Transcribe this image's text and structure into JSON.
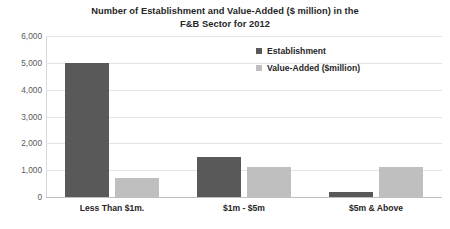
{
  "chart_data": {
    "type": "bar",
    "title": "Number of Establishment and Value-Added ($ million) in the F&B Sector for 2012",
    "title_lines": [
      "Number of Establishment and Value-Added ($ million) in the",
      "F&B Sector for 2012"
    ],
    "xlabel": "",
    "ylabel": "",
    "ylim": [
      0,
      6000
    ],
    "ytick_labels": [
      "6,000",
      "5,000",
      "4,000",
      "3,000",
      "2,000",
      "1,000",
      "0"
    ],
    "ytick_values": [
      6000,
      5000,
      4000,
      3000,
      2000,
      1000,
      0
    ],
    "grid": true,
    "legend_position": "top-right",
    "categories": [
      "Less Than $1m.",
      "$1m - $5m",
      "$5m & Above"
    ],
    "series": [
      {
        "name": "Establishment",
        "color": "#595959",
        "values": [
          5000,
          1500,
          200
        ]
      },
      {
        "name": "Value-Added ($million)",
        "color": "#bfbfbf",
        "values": [
          700,
          1100,
          1100
        ]
      }
    ]
  },
  "colors": {
    "establishment": "#595959",
    "value_added": "#bfbfbf",
    "gridline": "#e4e4e4",
    "text": "#262626",
    "axis_text": "#595959",
    "background": "#ffffff"
  }
}
